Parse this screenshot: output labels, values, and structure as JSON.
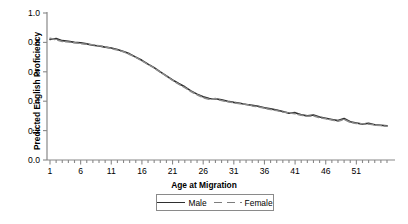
{
  "chart_data": {
    "type": "line",
    "title": "",
    "xlabel": "Age at Migration",
    "ylabel": "Predicted English Proficiency",
    "xlim": [
      1,
      56
    ],
    "ylim": [
      0,
      1
    ],
    "xticks": [
      1,
      6,
      11,
      16,
      21,
      26,
      31,
      36,
      41,
      46,
      51
    ],
    "yticks": [
      "0.0",
      "0.2",
      "0.4",
      "0.6",
      "0.8",
      "1.0"
    ],
    "ytick_values": [
      0.0,
      0.2,
      0.4,
      0.6,
      0.8,
      1.0
    ],
    "minor_tick_interval": 1,
    "grid": false,
    "legend_position": "below-axis-center",
    "x": [
      1,
      2,
      3,
      4,
      5,
      6,
      7,
      8,
      9,
      10,
      11,
      12,
      13,
      14,
      15,
      16,
      17,
      18,
      19,
      20,
      21,
      22,
      23,
      24,
      25,
      26,
      27,
      28,
      29,
      30,
      31,
      32,
      33,
      34,
      35,
      36,
      37,
      38,
      39,
      40,
      41,
      42,
      43,
      44,
      45,
      46,
      47,
      48,
      49,
      50,
      51,
      52,
      53,
      54,
      55,
      56
    ],
    "series": [
      {
        "name": "Male",
        "color": "#2f2f2f",
        "style": "solid",
        "values": [
          0.82,
          0.826,
          0.812,
          0.808,
          0.8,
          0.798,
          0.79,
          0.781,
          0.775,
          0.768,
          0.762,
          0.752,
          0.738,
          0.722,
          0.7,
          0.678,
          0.652,
          0.628,
          0.6,
          0.572,
          0.545,
          0.52,
          0.498,
          0.47,
          0.448,
          0.43,
          0.418,
          0.416,
          0.41,
          0.4,
          0.392,
          0.386,
          0.378,
          0.372,
          0.366,
          0.356,
          0.348,
          0.34,
          0.33,
          0.318,
          0.322,
          0.308,
          0.3,
          0.306,
          0.292,
          0.284,
          0.276,
          0.268,
          0.282,
          0.26,
          0.252,
          0.244,
          0.25,
          0.24,
          0.236,
          0.232
        ]
      },
      {
        "name": "Female",
        "color": "#8c8c8c",
        "style": "dashed",
        "values": [
          0.828,
          0.818,
          0.806,
          0.802,
          0.797,
          0.792,
          0.788,
          0.784,
          0.778,
          0.77,
          0.758,
          0.748,
          0.736,
          0.718,
          0.698,
          0.674,
          0.65,
          0.626,
          0.598,
          0.57,
          0.542,
          0.516,
          0.492,
          0.466,
          0.444,
          0.424,
          0.412,
          0.418,
          0.404,
          0.396,
          0.39,
          0.382,
          0.38,
          0.368,
          0.362,
          0.352,
          0.344,
          0.336,
          0.326,
          0.322,
          0.314,
          0.304,
          0.298,
          0.3,
          0.288,
          0.28,
          0.272,
          0.264,
          0.276,
          0.256,
          0.248,
          0.246,
          0.244,
          0.238,
          0.234,
          0.23
        ]
      }
    ]
  },
  "axis": {
    "x_title": "Age at Migration",
    "y_title": "Predicted English Proficiency"
  },
  "legend": {
    "items": [
      {
        "label": "Male"
      },
      {
        "label": "Female"
      }
    ]
  }
}
